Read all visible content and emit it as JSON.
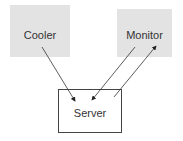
{
  "diagram": {
    "nodes": [
      {
        "id": "cooler",
        "label": "Cooler"
      },
      {
        "id": "monitor",
        "label": "Monitor"
      },
      {
        "id": "server",
        "label": "Server"
      }
    ],
    "edges": [
      {
        "from": "cooler",
        "to": "server"
      },
      {
        "from": "monitor",
        "to": "server"
      },
      {
        "from": "server",
        "to": "monitor"
      }
    ]
  }
}
